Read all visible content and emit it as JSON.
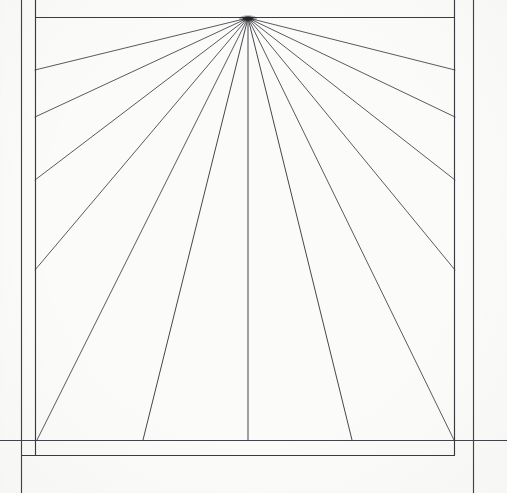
{
  "figure": {
    "type": "line-drawing",
    "medium": "pen on paper",
    "background_color": "#fbfbf9",
    "ink_color": "#2e2e33",
    "canvas": {
      "width": 507,
      "height": 493
    }
  },
  "geometry": {
    "vanishing_point": {
      "x": 248,
      "y": 18,
      "label": "vanishing-point"
    },
    "outer_frame": {
      "left_vertical_x": 21,
      "right_vertical_x": 474,
      "bottom_horizontal_y": 440,
      "left_vertical_y1": 0,
      "left_vertical_y2": 493,
      "right_vertical_y1": 0,
      "right_vertical_y2": 493,
      "bottom_horizontal_x1": 0,
      "bottom_horizontal_x2": 507
    },
    "inner_rectangle": {
      "left_x": 35,
      "right_x": 455,
      "top_y": 17,
      "bottom_y": 455,
      "stroke_width": 1.1
    },
    "picture_plane": {
      "left_x": 35,
      "right_x": 455,
      "top_y": 17,
      "bottom_y": 440
    },
    "stroke_width_rays": 0.9,
    "stroke_width_frame": 1.15
  },
  "chart_data": {
    "type": "line",
    "xlabel": "",
    "ylabel": "",
    "xlim": [
      0,
      507
    ],
    "ylim": [
      0,
      493
    ],
    "grid": false,
    "legend": "none",
    "annotations": [
      "Rays converge at a single vanishing point near the top center",
      "Rays terminate on the left edge, bottom edge and right edge of the picture plane"
    ],
    "series": [
      {
        "name": "ray-left-1",
        "x": [
          248,
          35
        ],
        "y": [
          18,
          70
        ]
      },
      {
        "name": "ray-left-2",
        "x": [
          248,
          35
        ],
        "y": [
          18,
          117
        ]
      },
      {
        "name": "ray-left-3",
        "x": [
          248,
          35
        ],
        "y": [
          18,
          180
        ]
      },
      {
        "name": "ray-left-4",
        "x": [
          248,
          35
        ],
        "y": [
          18,
          270
        ]
      },
      {
        "name": "ray-left-5",
        "x": [
          248,
          37
        ],
        "y": [
          18,
          440
        ]
      },
      {
        "name": "ray-left-6",
        "x": [
          248,
          143
        ],
        "y": [
          18,
          440
        ]
      },
      {
        "name": "ray-center",
        "x": [
          248,
          248
        ],
        "y": [
          18,
          440
        ]
      },
      {
        "name": "ray-right-6",
        "x": [
          248,
          352
        ],
        "y": [
          18,
          440
        ]
      },
      {
        "name": "ray-right-5",
        "x": [
          248,
          454
        ],
        "y": [
          18,
          440
        ]
      },
      {
        "name": "ray-right-4",
        "x": [
          248,
          455
        ],
        "y": [
          18,
          270
        ]
      },
      {
        "name": "ray-right-3",
        "x": [
          248,
          455
        ],
        "y": [
          18,
          180
        ]
      },
      {
        "name": "ray-right-2",
        "x": [
          248,
          455
        ],
        "y": [
          18,
          117
        ]
      },
      {
        "name": "ray-right-1",
        "x": [
          248,
          455
        ],
        "y": [
          18,
          70
        ]
      },
      {
        "name": "frame-top",
        "x": [
          35,
          455
        ],
        "y": [
          17,
          17
        ]
      },
      {
        "name": "frame-left",
        "x": [
          35,
          35
        ],
        "y": [
          17,
          455
        ]
      },
      {
        "name": "frame-right",
        "x": [
          455,
          455
        ],
        "y": [
          17,
          455
        ]
      },
      {
        "name": "frame-inner-bottom",
        "x": [
          35,
          455
        ],
        "y": [
          455,
          455
        ]
      },
      {
        "name": "baseline-horizontal",
        "x": [
          0,
          507
        ],
        "y": [
          440,
          440
        ]
      },
      {
        "name": "guide-left-vertical",
        "x": [
          21,
          21
        ],
        "y": [
          0,
          493
        ]
      },
      {
        "name": "guide-right-vertical",
        "x": [
          474,
          474
        ],
        "y": [
          0,
          493
        ]
      }
    ]
  },
  "layers": [
    {
      "id": "guides",
      "label": "Construction guides",
      "visible": true
    },
    {
      "id": "frame",
      "label": "Picture frame",
      "visible": true
    },
    {
      "id": "rays",
      "label": "Perspective rays",
      "visible": true
    },
    {
      "id": "vanishing",
      "label": "Vanishing point",
      "visible": true
    }
  ]
}
